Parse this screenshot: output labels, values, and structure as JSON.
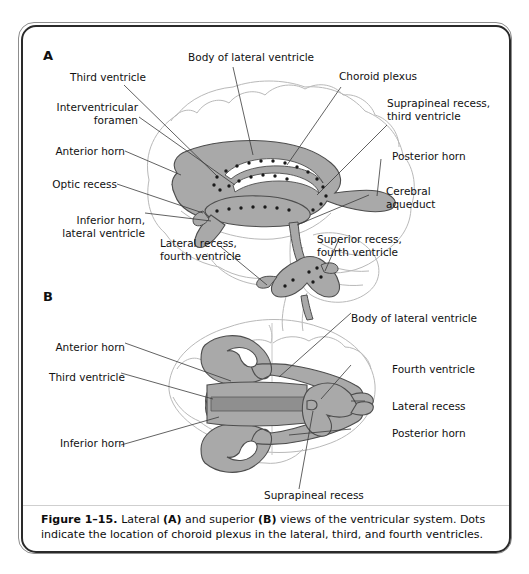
{
  "figure": {
    "number": "Figure 1–15.",
    "caption_parts": {
      "lead": "Lateral ",
      "panel_a": "(A)",
      "mid": " and superior ",
      "panel_b": "(B)",
      "tail": " views of the ventricular system. Dots indicate the location of choroid plexus in the lateral, third, and fourth ventricles."
    },
    "caption_full": "Figure 1–15. Lateral (A) and superior (B) views of the ventricular system. Dots indicate the location of choroid plexus in the lateral, third, and fourth ventricles."
  },
  "panels": [
    {
      "id": "A",
      "letter": "A",
      "view": "Lateral",
      "labels": [
        {
          "key": "third_ventricle_a",
          "text": "Third ventricle"
        },
        {
          "key": "body_of_lateral_ventricle_a",
          "text": "Body of lateral ventricle"
        },
        {
          "key": "choroid_plexus_a",
          "text": "Choroid plexus"
        },
        {
          "key": "interventricular_foramen_a",
          "text": "Interventricular\nforamen"
        },
        {
          "key": "suprapineal_recess_third_ventricle_a",
          "text": "Suprapineal recess,\nthird ventricle"
        },
        {
          "key": "anterior_horn_a",
          "text": "Anterior horn"
        },
        {
          "key": "posterior_horn_a",
          "text": "Posterior horn"
        },
        {
          "key": "optic_recess_a",
          "text": "Optic recess"
        },
        {
          "key": "cerebral_aqueduct_a",
          "text": "Cerebral\naqueduct"
        },
        {
          "key": "inferior_horn_lateral_ventricle_a",
          "text": "Inferior horn,\nlateral ventricle"
        },
        {
          "key": "lateral_recess_fourth_ventricle_a",
          "text": "Lateral recess,\nfourth ventricle"
        },
        {
          "key": "superior_recess_fourth_ventricle_a",
          "text": "Superior recess,\nfourth ventricle"
        }
      ]
    },
    {
      "id": "B",
      "letter": "B",
      "view": "Superior",
      "labels": [
        {
          "key": "body_of_lateral_ventricle_b",
          "text": "Body of lateral ventricle"
        },
        {
          "key": "anterior_horn_b",
          "text": "Anterior horn"
        },
        {
          "key": "fourth_ventricle_b",
          "text": "Fourth ventricle"
        },
        {
          "key": "third_ventricle_b",
          "text": "Third ventricle"
        },
        {
          "key": "lateral_recess_b",
          "text": "Lateral recess"
        },
        {
          "key": "inferior_horn_b",
          "text": "Inferior horn"
        },
        {
          "key": "posterior_horn_b",
          "text": "Posterior horn"
        },
        {
          "key": "suprapineal_recess_b",
          "text": "Suprapineal recess"
        }
      ]
    }
  ],
  "colors": {
    "ventricle_fill": "#a9a9a9",
    "ventricle_stroke": "#4d4d4d",
    "brain_outline": "#b9b9b9",
    "leader_line": "#3a3a3a",
    "choroid_dot": "#1a1a1a",
    "frame_dark": "#2a2a2a",
    "frame_light": "#8d8d8d",
    "page_background": "#ffffff",
    "text": "#111111"
  }
}
